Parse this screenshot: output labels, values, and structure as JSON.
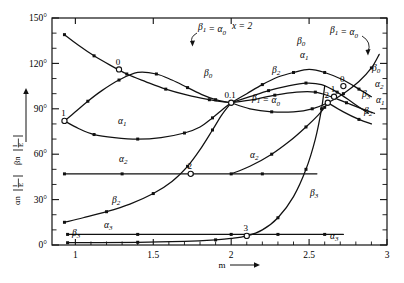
{
  "chart_data": {
    "type": "line",
    "title": "",
    "annotation": "x = 2",
    "xlabel": "m",
    "ylabel_upper": "βn |I/E|",
    "ylabel_lower": "αn |I/E|",
    "xlim": [
      0.85,
      3.0
    ],
    "ylim": [
      0,
      150
    ],
    "xticks": [
      "1",
      "1.5",
      "2",
      "2.5",
      "3"
    ],
    "xtick_values": [
      1,
      1.5,
      2,
      2.5,
      3
    ],
    "yticks": [
      "0°",
      "30°",
      "60°",
      "90°",
      "120°",
      "150°"
    ],
    "ytick_values": [
      0,
      30,
      60,
      90,
      120,
      150
    ],
    "y_minor_step": 10,
    "grid": false,
    "legend": "none",
    "units": "degrees",
    "series": [
      {
        "name": "β0-left",
        "label": "β0",
        "points": [
          [
            0.93,
            139
          ],
          [
            1.02,
            132
          ],
          [
            1.12,
            125
          ],
          [
            1.22,
            119
          ],
          [
            1.33,
            113
          ],
          [
            1.45,
            108
          ],
          [
            1.58,
            103
          ],
          [
            1.72,
            99
          ],
          [
            1.86,
            96
          ],
          [
            1.95,
            94.5
          ],
          [
            2.0,
            94
          ]
        ]
      },
      {
        "name": "β1=α0-rise",
        "label": "β1 = α0",
        "points": [
          [
            0.93,
            82
          ],
          [
            1.0,
            88
          ],
          [
            1.08,
            95
          ],
          [
            1.17,
            102
          ],
          [
            1.28,
            109
          ],
          [
            1.4,
            114
          ],
          [
            1.52,
            113
          ],
          [
            1.62,
            109
          ],
          [
            1.72,
            104
          ],
          [
            1.82,
            99
          ],
          [
            1.9,
            96
          ],
          [
            1.97,
            94.5
          ],
          [
            2.0,
            94
          ]
        ]
      },
      {
        "name": "α1-dip",
        "label": "α1",
        "points": [
          [
            0.93,
            82
          ],
          [
            1.02,
            77
          ],
          [
            1.12,
            73
          ],
          [
            1.25,
            71
          ],
          [
            1.4,
            70
          ],
          [
            1.55,
            71
          ],
          [
            1.7,
            74
          ],
          [
            1.8,
            78
          ],
          [
            1.88,
            84
          ],
          [
            1.95,
            90
          ],
          [
            2.0,
            94
          ]
        ]
      },
      {
        "name": "α2-flat",
        "label": "α2",
        "points": [
          [
            0.93,
            47
          ],
          [
            1.1,
            47
          ],
          [
            1.3,
            47
          ],
          [
            1.5,
            47
          ],
          [
            1.75,
            47
          ],
          [
            2.0,
            47
          ],
          [
            2.2,
            47
          ],
          [
            2.4,
            47
          ],
          [
            2.55,
            47
          ]
        ]
      },
      {
        "name": "β2-rise",
        "label": "β2",
        "points": [
          [
            0.93,
            15
          ],
          [
            1.05,
            18
          ],
          [
            1.2,
            22
          ],
          [
            1.35,
            27
          ],
          [
            1.5,
            34
          ],
          [
            1.62,
            42
          ],
          [
            1.72,
            52
          ],
          [
            1.8,
            63
          ],
          [
            1.88,
            76
          ],
          [
            1.94,
            86
          ],
          [
            2.0,
            94
          ]
        ]
      },
      {
        "name": "α3-flat",
        "label": "α3",
        "points": [
          [
            0.95,
            7
          ],
          [
            1.15,
            7
          ],
          [
            1.4,
            7
          ],
          [
            1.7,
            7
          ],
          [
            2.0,
            7
          ],
          [
            2.15,
            7
          ],
          [
            2.3,
            7
          ]
        ]
      },
      {
        "name": "β3-flat-rise",
        "label": "β3",
        "points": [
          [
            0.95,
            1.5
          ],
          [
            1.15,
            1.6
          ],
          [
            1.4,
            1.8
          ],
          [
            1.7,
            2.4
          ],
          [
            1.9,
            3.4
          ],
          [
            2.0,
            4.3
          ],
          [
            2.1,
            6
          ],
          [
            2.2,
            10
          ],
          [
            2.3,
            18
          ],
          [
            2.4,
            32
          ],
          [
            2.48,
            50
          ],
          [
            2.54,
            70
          ],
          [
            2.58,
            90
          ],
          [
            2.6,
            105
          ]
        ]
      },
      {
        "name": "β0-right",
        "label": "β0",
        "points": [
          [
            2.0,
            94
          ],
          [
            2.1,
            100
          ],
          [
            2.2,
            106
          ],
          [
            2.3,
            111
          ],
          [
            2.4,
            114
          ],
          [
            2.5,
            116
          ],
          [
            2.6,
            114
          ],
          [
            2.72,
            109
          ],
          [
            2.82,
            103
          ],
          [
            2.9,
            98
          ]
        ]
      },
      {
        "name": "α1-right",
        "label": "α1",
        "points": [
          [
            2.0,
            94
          ],
          [
            2.12,
            98
          ],
          [
            2.24,
            102
          ],
          [
            2.36,
            105
          ],
          [
            2.48,
            107
          ],
          [
            2.58,
            106
          ],
          [
            2.68,
            101
          ],
          [
            2.78,
            94
          ],
          [
            2.88,
            87
          ]
        ]
      },
      {
        "name": "α2-right",
        "label": "α2",
        "points": [
          [
            2.0,
            94
          ],
          [
            2.14,
            96
          ],
          [
            2.28,
            99
          ],
          [
            2.42,
            101
          ],
          [
            2.54,
            101
          ],
          [
            2.64,
            98
          ],
          [
            2.74,
            94
          ],
          [
            2.84,
            90
          ],
          [
            2.92,
            87
          ]
        ]
      },
      {
        "name": "β1=α0-right",
        "label": "β1 = α0",
        "points": [
          [
            2.0,
            94
          ],
          [
            2.12,
            90
          ],
          [
            2.26,
            88
          ],
          [
            2.4,
            88
          ],
          [
            2.52,
            90
          ],
          [
            2.62,
            94
          ],
          [
            2.72,
            100
          ],
          [
            2.82,
            108
          ],
          [
            2.9,
            117
          ],
          [
            2.95,
            126
          ]
        ]
      },
      {
        "name": "α2-lower-rise",
        "label": "α2",
        "points": [
          [
            2.0,
            47
          ],
          [
            2.12,
            52
          ],
          [
            2.26,
            60
          ],
          [
            2.38,
            69
          ],
          [
            2.48,
            78
          ],
          [
            2.56,
            86
          ],
          [
            2.6,
            91
          ],
          [
            2.62,
            94
          ]
        ]
      },
      {
        "name": "α3-right",
        "label": "α3",
        "points": [
          [
            2.3,
            7
          ],
          [
            2.45,
            7
          ],
          [
            2.6,
            7
          ],
          [
            2.72,
            7
          ]
        ]
      },
      {
        "name": "β2-right-tail",
        "label": "β2",
        "points": [
          [
            2.62,
            94
          ],
          [
            2.72,
            88
          ],
          [
            2.82,
            83
          ],
          [
            2.9,
            80
          ]
        ]
      }
    ],
    "branch_markers": [
      {
        "label": "0",
        "x": 1.28,
        "y": 116
      },
      {
        "label": "1",
        "x": 0.93,
        "y": 82
      },
      {
        "label": "2",
        "x": 1.74,
        "y": 47
      },
      {
        "label": "0.1",
        "x": 2.0,
        "y": 94
      },
      {
        "label": "3",
        "x": 2.1,
        "y": 6
      },
      {
        "label": "0",
        "x": 2.72,
        "y": 105
      },
      {
        "label": "1",
        "x": 2.66,
        "y": 98
      },
      {
        "label": "2",
        "x": 2.62,
        "y": 94
      }
    ],
    "curve_labels": [
      {
        "text": "β1 = α0",
        "x": 198,
        "y": 30
      },
      {
        "text": "β0",
        "x": 204,
        "y": 76
      },
      {
        "text": "x = 2",
        "x": 232,
        "y": 29
      },
      {
        "text": "β0",
        "x": 297,
        "y": 44
      },
      {
        "text": "α1",
        "x": 300,
        "y": 58
      },
      {
        "text": "β1 = α0",
        "x": 330,
        "y": 33
      },
      {
        "text": "β2",
        "x": 272,
        "y": 73
      },
      {
        "text": "β1 = α0",
        "x": 252,
        "y": 101
      },
      {
        "text": "α1",
        "x": 118,
        "y": 124
      },
      {
        "text": "α2",
        "x": 119,
        "y": 162
      },
      {
        "text": "β2",
        "x": 112,
        "y": 203
      },
      {
        "text": "α3",
        "x": 104,
        "y": 228
      },
      {
        "text": "β3",
        "x": 72,
        "y": 236
      },
      {
        "text": "α2",
        "x": 250,
        "y": 158
      },
      {
        "text": "β3",
        "x": 310,
        "y": 196
      },
      {
        "text": "α3",
        "x": 330,
        "y": 239
      },
      {
        "text": "β0",
        "x": 372,
        "y": 71
      },
      {
        "text": "α2",
        "x": 375,
        "y": 87
      },
      {
        "text": "α1",
        "x": 376,
        "y": 103
      },
      {
        "text": "β3",
        "x": 362,
        "y": 97
      },
      {
        "text": "β2",
        "x": 364,
        "y": 114
      }
    ]
  },
  "axes": {
    "x_axis_name": "m",
    "x_arrow": "→",
    "y_arrow": "↑",
    "y_numerator_upper": "βn",
    "y_numerator_lower": "αn",
    "y_fraction_top": "I",
    "y_fraction_bottom": "E"
  }
}
